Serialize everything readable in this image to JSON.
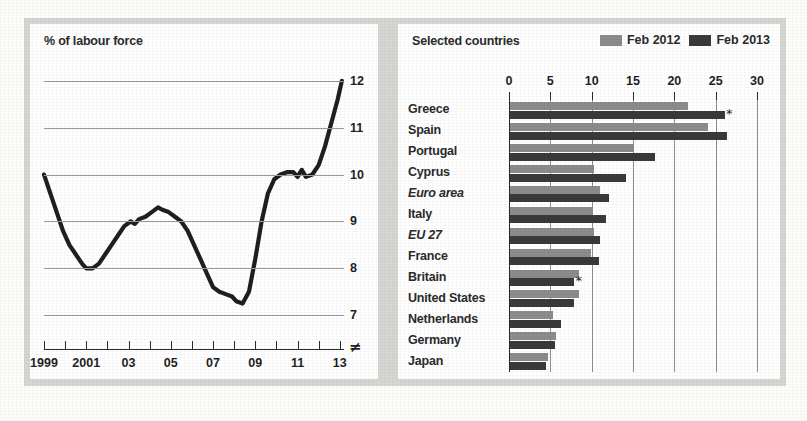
{
  "left_panel": {
    "title": "% of labour force"
  },
  "right_panel": {
    "title": "Selected countries",
    "legend": [
      {
        "label": "Feb 2012",
        "color": "#8c8c8c"
      },
      {
        "label": "Feb 2013",
        "color": "#3a3a3a"
      }
    ]
  },
  "colors": {
    "series_2012": "#8c8c8c",
    "series_2013": "#3a3a3a",
    "line": "#1f1f1f",
    "gridline": "#9a9a9a",
    "axis": "#2b2b2b",
    "panel_bg": "#ffffff",
    "mount_bg": "#d8d6d2"
  },
  "footnote_symbol": "*",
  "axis_break_symbol": "≠",
  "chart_data": [
    {
      "type": "line",
      "title": "% of labour force",
      "xlabel": "",
      "ylabel": "% of labour force",
      "ylim": [
        6.6,
        12.4
      ],
      "xlim": [
        1999,
        2013.2
      ],
      "grid": "horizontal",
      "ytick_labels": [
        "7",
        "8",
        "9",
        "10",
        "11",
        "12"
      ],
      "yticks": [
        7,
        8,
        9,
        10,
        11,
        12
      ],
      "xtick_labels": [
        "1999",
        "2001",
        "03",
        "05",
        "07",
        "09",
        "11",
        "13"
      ],
      "xticks": [
        1999,
        2001,
        2003,
        2005,
        2007,
        2009,
        2011,
        2013
      ],
      "xtick_minor": [
        1999,
        2000,
        2001,
        2002,
        2003,
        2004,
        2005,
        2006,
        2007,
        2008,
        2009,
        2010,
        2011,
        2012,
        2013
      ],
      "series": [
        {
          "name": "Euro-area unemployment rate",
          "x": [
            1999.0,
            1999.3,
            1999.6,
            1999.9,
            2000.2,
            2000.5,
            2000.8,
            2001.0,
            2001.3,
            2001.6,
            2001.9,
            2002.2,
            2002.5,
            2002.8,
            2003.1,
            2003.3,
            2003.5,
            2003.8,
            2004.1,
            2004.4,
            2004.6,
            2004.9,
            2005.2,
            2005.5,
            2005.8,
            2006.1,
            2006.4,
            2006.7,
            2007.0,
            2007.3,
            2007.6,
            2007.9,
            2008.1,
            2008.4,
            2008.7,
            2009.0,
            2009.3,
            2009.6,
            2009.9,
            2010.2,
            2010.5,
            2010.8,
            2011.0,
            2011.2,
            2011.4,
            2011.7,
            2012.0,
            2012.3,
            2012.6,
            2012.9,
            2013.1
          ],
          "y": [
            10.0,
            9.6,
            9.2,
            8.8,
            8.5,
            8.3,
            8.1,
            8.0,
            8.0,
            8.1,
            8.3,
            8.5,
            8.7,
            8.9,
            9.0,
            8.95,
            9.05,
            9.1,
            9.2,
            9.3,
            9.25,
            9.2,
            9.1,
            9.0,
            8.8,
            8.5,
            8.2,
            7.9,
            7.6,
            7.5,
            7.45,
            7.4,
            7.3,
            7.25,
            7.5,
            8.2,
            9.0,
            9.6,
            9.9,
            10.0,
            10.05,
            10.05,
            9.95,
            10.1,
            9.95,
            10.0,
            10.2,
            10.6,
            11.1,
            11.6,
            12.0
          ]
        }
      ]
    },
    {
      "type": "bar",
      "orientation": "horizontal",
      "title": "Selected countries",
      "xlabel": "",
      "ylabel": "",
      "xlim": [
        0,
        30
      ],
      "xticks": [
        0,
        5,
        10,
        15,
        20,
        25,
        30
      ],
      "xtick_labels": [
        "0",
        "5",
        "10",
        "15",
        "20",
        "25",
        "30"
      ],
      "grid": "vertical",
      "legend_position": "top-right",
      "categories": [
        "Greece",
        "Spain",
        "Portugal",
        "Cyprus",
        "Euro area",
        "Italy",
        "EU 27",
        "France",
        "Britain",
        "United States",
        "Netherlands",
        "Germany",
        "Japan"
      ],
      "categories_italic": [
        "Euro area",
        "EU 27"
      ],
      "series": [
        {
          "name": "Feb 2012",
          "values": [
            21.5,
            23.9,
            15.0,
            10.2,
            10.9,
            9.9,
            10.2,
            9.8,
            8.3,
            8.3,
            5.2,
            5.6,
            4.6
          ]
        },
        {
          "name": "Feb 2013",
          "values": [
            26.0,
            26.3,
            17.5,
            14.0,
            12.0,
            11.6,
            10.9,
            10.8,
            7.8,
            7.7,
            6.2,
            5.4,
            4.3
          ]
        }
      ],
      "annotations": [
        {
          "category": "Greece",
          "series": "Feb 2013",
          "marker": "*"
        },
        {
          "category": "Britain",
          "series": "Feb 2013",
          "marker": "*"
        }
      ]
    }
  ]
}
